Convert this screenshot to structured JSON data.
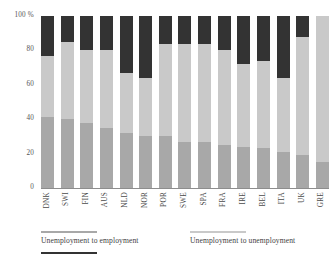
{
  "chart_data": {
    "type": "bar",
    "title": "",
    "subtitle": "",
    "xlabel": "",
    "ylabel": "",
    "ylim": [
      0,
      100
    ],
    "y_unit": "%",
    "stacked": true,
    "stack_normalized": true,
    "grid": false,
    "legend_position": "bottom",
    "categories": [
      "DNK",
      "SWI",
      "FIN",
      "AUS",
      "NLD",
      "NOR",
      "POR",
      "SWE",
      "SPA",
      "FRA",
      "IRE",
      "BEL",
      "ITA",
      "UK",
      "GRE"
    ],
    "ytick_labels": [
      "100 %",
      "80",
      "60",
      "40",
      "20",
      "0"
    ],
    "ytick_values": [
      100,
      80,
      60,
      40,
      20,
      0
    ],
    "series": [
      {
        "name": "Unemployment to employment",
        "color": "#a8a8a8",
        "values": [
          41,
          40,
          38,
          35,
          32,
          30,
          30,
          27,
          27,
          25,
          24,
          23,
          21,
          19,
          15
        ]
      },
      {
        "name": "Unemployment to unemployment",
        "color": "#c9c9c9",
        "values": [
          36,
          45,
          42,
          45,
          35,
          34,
          54,
          57,
          57,
          55,
          48,
          51,
          43,
          69,
          85
        ]
      },
      {
        "name": "",
        "color": "#333333",
        "values": [
          23,
          15,
          20,
          20,
          33,
          36,
          16,
          16,
          16,
          20,
          28,
          26,
          36,
          12,
          0
        ]
      }
    ]
  },
  "legend": {
    "entries": [
      {
        "label": "Unemployment to employment",
        "color": "#a8a8a8"
      },
      {
        "label": "Unemployment to unemployment",
        "color": "#c9c9c9"
      },
      {
        "label": "",
        "color": "#333333"
      }
    ]
  },
  "colors": {
    "segment_bottom": "#a8a8a8",
    "segment_middle": "#c9c9c9",
    "segment_top": "#333333",
    "axis": "#8d8d8d",
    "text": "#4a4a4a",
    "background": "#ffffff"
  }
}
